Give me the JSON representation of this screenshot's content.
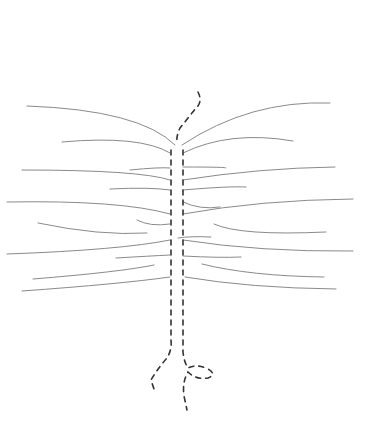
{
  "figure": {
    "type": "line-sketch",
    "background": "#ffffff",
    "colors": {
      "branch": "#8a8a8a",
      "spine": "#333333"
    },
    "spine": [
      {
        "id": "top-curl",
        "d": "M198 92 Q203 102 196 108 Q188 118 180 128 Q176 136 177 144"
      },
      {
        "id": "left-rail",
        "d": "M171 150 L171 340 Q172 350 167 358 Q158 368 151 380 L155 392"
      },
      {
        "id": "right-rail",
        "d": "M183 150 L183 352 Q184 362 188 368 Q196 364 206 368 Q218 374 208 378 Q196 380 188 372 Q182 382 184 396 L187 410"
      }
    ],
    "branches": [
      {
        "d": "M27 106 Q140 110 175 145"
      },
      {
        "d": "M62 142 Q140 135 170 153"
      },
      {
        "d": "M22 170 Q140 170 170 180"
      },
      {
        "d": "M130 170 Q160 167 170 168"
      },
      {
        "d": "M110 189 Q150 187 170 190"
      },
      {
        "d": "M7 202 Q120 200 170 214"
      },
      {
        "d": "M137 220 Q150 227 170 224"
      },
      {
        "d": "M38 223 Q100 236 147 233"
      },
      {
        "d": "M7 254 Q120 250 170 240"
      },
      {
        "d": "M116 258 Q150 256 170 255"
      },
      {
        "d": "M33 279 Q120 272 154 265"
      },
      {
        "d": "M22 291 Q120 284 170 277"
      },
      {
        "d": "M182 145 Q250 100 330 103"
      },
      {
        "d": "M183 153 Q230 130 293 141"
      },
      {
        "d": "M183 167 Q230 167 226 168"
      },
      {
        "d": "M183 180 Q260 168 335 167"
      },
      {
        "d": "M183 190 Q230 186 246 187"
      },
      {
        "d": "M183 202 Q200 210 220 207"
      },
      {
        "d": "M183 214 Q260 200 353 199"
      },
      {
        "d": "M214 224 Q240 236 326 232"
      },
      {
        "d": "M178 238 Q190 236 211 237"
      },
      {
        "d": "M183 240 Q260 252 353 251"
      },
      {
        "d": "M183 256 Q220 258 241 257"
      },
      {
        "d": "M202 264 Q250 276 324 277"
      },
      {
        "d": "M185 277 Q250 288 336 289"
      }
    ]
  }
}
